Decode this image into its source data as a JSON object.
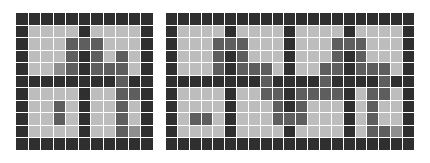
{
  "legend": {
    "D": {
      "meaning": "wall",
      "color": "#2f2f2f"
    },
    "M": {
      "meaning": "path",
      "color": "#5e5e5e"
    },
    "m": {
      "meaning": "path-light",
      "color": "#8e8e8e"
    },
    "L": {
      "meaning": "floor",
      "color": "#bdbdbd"
    }
  },
  "grids": [
    {
      "name": "left",
      "rows": [
        "DDDDDDDDDDD",
        "DLLLLDLLLLD",
        "DLLLMMMLLLD",
        "DLLLMDMLMLD",
        "DLLmMDMMMLD",
        "DDDDDDDDMDD",
        "DLLLLDLLMMD",
        "DLLMLDLLMLD",
        "DLLMLDLLMLD",
        "DLLLLDLLMmD",
        "DDDDDDDDDDD"
      ]
    },
    {
      "name": "right",
      "rows": [
        "DDDDDDDDDDDDDDDDDDDDD",
        "DLLLLDLLLLDLLLLDLLLLD",
        "DLLLMMMLLLDLLLMMMLLLD",
        "DLLLMDMLLLDLLLMDMLLLD",
        "DLLLMDMMMLDLLMMDMMMLD",
        "DDDDDDDDMDDDDMDDDDMDD",
        "DLLLLDLLMMDMMMMDLMMLD",
        "DLLLLDLLLMDMLLLDLMLLD",
        "DLMMLDLLLMMMLLLDLMLLD",
        "DLLLLDLLLLDLLLLDLMMmD",
        "DDDDDDDDDDDDDDDDDDDDD"
      ]
    }
  ]
}
